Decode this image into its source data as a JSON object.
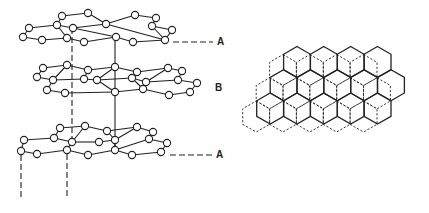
{
  "figure": {
    "stroke_color": "#222222",
    "background": "#ffffff"
  },
  "labels": {
    "top_a": {
      "text": "A",
      "x": 217,
      "y": 37
    },
    "middle_b": {
      "text": "B",
      "x": 215,
      "y": 83
    },
    "bottom_a": {
      "text": "A",
      "x": 216,
      "y": 150
    }
  },
  "stacking_view": {
    "layers": [
      {
        "name": "layer-A-top",
        "nodes": [
          [
            62,
            16
          ],
          [
            88,
            13
          ],
          [
            135,
            15
          ],
          [
            156,
            18
          ],
          [
            29,
            28
          ],
          [
            57,
            25
          ],
          [
            73,
            28
          ],
          [
            106,
            24
          ],
          [
            152,
            26
          ],
          [
            172,
            30
          ],
          [
            23,
            37
          ],
          [
            42,
            40
          ],
          [
            67,
            38
          ],
          [
            84,
            42
          ],
          [
            116,
            37
          ],
          [
            133,
            42
          ],
          [
            165,
            40
          ]
        ],
        "edges": [
          [
            0,
            1
          ],
          [
            1,
            7
          ],
          [
            7,
            2
          ],
          [
            2,
            3
          ],
          [
            0,
            5
          ],
          [
            5,
            6
          ],
          [
            6,
            7
          ],
          [
            7,
            16
          ],
          [
            3,
            8
          ],
          [
            8,
            9
          ],
          [
            9,
            16
          ],
          [
            5,
            4
          ],
          [
            4,
            10
          ],
          [
            10,
            11
          ],
          [
            11,
            12
          ],
          [
            12,
            5
          ],
          [
            12,
            13
          ],
          [
            13,
            14
          ],
          [
            14,
            6
          ],
          [
            14,
            15
          ],
          [
            15,
            16
          ],
          [
            8,
            16
          ]
        ]
      },
      {
        "name": "layer-B-middle",
        "nodes": [
          [
            43,
            68
          ],
          [
            67,
            65
          ],
          [
            88,
            70
          ],
          [
            115,
            67
          ],
          [
            137,
            72
          ],
          [
            168,
            68
          ],
          [
            182,
            71
          ],
          [
            37,
            77
          ],
          [
            53,
            80
          ],
          [
            84,
            79
          ],
          [
            97,
            80
          ],
          [
            132,
            78
          ],
          [
            146,
            82
          ],
          [
            178,
            80
          ],
          [
            197,
            83
          ],
          [
            47,
            90
          ],
          [
            65,
            93
          ],
          [
            115,
            92
          ],
          [
            143,
            89
          ],
          [
            169,
            95
          ],
          [
            190,
            92
          ]
        ],
        "edges": [
          [
            0,
            1
          ],
          [
            1,
            2
          ],
          [
            2,
            3
          ],
          [
            3,
            4
          ],
          [
            4,
            5
          ],
          [
            5,
            6
          ],
          [
            0,
            7
          ],
          [
            7,
            8
          ],
          [
            8,
            1
          ],
          [
            2,
            9
          ],
          [
            9,
            10
          ],
          [
            10,
            3
          ],
          [
            4,
            11
          ],
          [
            11,
            12
          ],
          [
            12,
            5
          ],
          [
            6,
            13
          ],
          [
            13,
            14
          ],
          [
            8,
            9
          ],
          [
            10,
            11
          ],
          [
            12,
            13
          ],
          [
            8,
            15
          ],
          [
            15,
            16
          ],
          [
            16,
            17
          ],
          [
            17,
            10
          ],
          [
            11,
            18
          ],
          [
            18,
            17
          ],
          [
            12,
            18
          ],
          [
            18,
            19
          ],
          [
            19,
            20
          ],
          [
            20,
            14
          ]
        ]
      },
      {
        "name": "layer-A-bottom",
        "nodes": [
          [
            60,
            128
          ],
          [
            85,
            126
          ],
          [
            107,
            131
          ],
          [
            137,
            127
          ],
          [
            153,
            132
          ],
          [
            24,
            140
          ],
          [
            54,
            138
          ],
          [
            72,
            142
          ],
          [
            99,
            142
          ],
          [
            115,
            140
          ],
          [
            149,
            139
          ],
          [
            167,
            143
          ],
          [
            21,
            151
          ],
          [
            37,
            154
          ],
          [
            67,
            150
          ],
          [
            88,
            155
          ],
          [
            115,
            150
          ],
          [
            132,
            155
          ],
          [
            161,
            152
          ]
        ],
        "edges": [
          [
            0,
            1
          ],
          [
            1,
            2
          ],
          [
            2,
            3
          ],
          [
            3,
            4
          ],
          [
            0,
            6
          ],
          [
            6,
            7
          ],
          [
            7,
            1
          ],
          [
            2,
            9
          ],
          [
            9,
            3
          ],
          [
            4,
            10
          ],
          [
            10,
            11
          ],
          [
            6,
            5
          ],
          [
            5,
            12
          ],
          [
            12,
            13
          ],
          [
            13,
            14
          ],
          [
            14,
            7
          ],
          [
            7,
            8
          ],
          [
            8,
            9
          ],
          [
            9,
            16
          ],
          [
            14,
            15
          ],
          [
            15,
            16
          ],
          [
            16,
            17
          ],
          [
            17,
            18
          ],
          [
            18,
            11
          ],
          [
            10,
            16
          ]
        ]
      }
    ],
    "node_radius": 3.6,
    "connectors": [
      {
        "type": "dashed",
        "x1": 72,
        "y1": 28,
        "x2": 72,
        "y2": 142
      },
      {
        "type": "solid",
        "x1": 115,
        "y1": 37,
        "x2": 115,
        "y2": 150
      },
      {
        "type": "dashed",
        "x1": 21,
        "y1": 155,
        "x2": 21,
        "y2": 198
      },
      {
        "type": "dashed",
        "x1": 67,
        "y1": 154,
        "x2": 67,
        "y2": 198
      }
    ],
    "reference_lines": [
      {
        "name": "ref-line-top-a",
        "x1": 173,
        "y1": 42,
        "x2": 213,
        "y2": 42
      },
      {
        "name": "ref-line-bottom-a",
        "x1": 170,
        "y1": 155,
        "x2": 213,
        "y2": 155
      }
    ]
  },
  "plan_view": {
    "hex_radius": 15.5,
    "solid_layer": {
      "origin_x": 297,
      "origin_y": 62,
      "rows": [
        {
          "offset": 0,
          "count": 4
        },
        {
          "offset": -0.5,
          "count": 5
        },
        {
          "offset": -1,
          "count": 5
        }
      ]
    },
    "dashed_layer": {
      "origin_x": 283,
      "origin_y": 70,
      "rows": [
        {
          "offset": 0,
          "count": 4
        },
        {
          "offset": -0.5,
          "count": 5
        },
        {
          "offset": -1,
          "count": 5
        }
      ]
    }
  }
}
